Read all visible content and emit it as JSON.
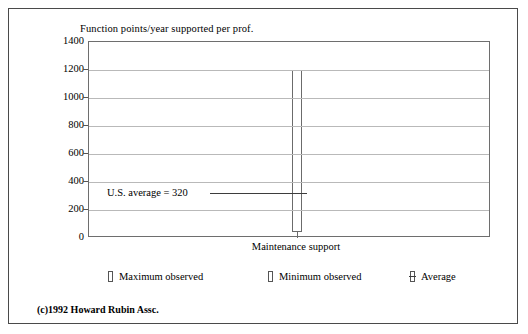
{
  "figure": {
    "copyright": "(c)1992 Howard Rubin Assc."
  },
  "chart_data": {
    "type": "bar",
    "title": "Function points/year supported per prof.",
    "xlabel": "",
    "ylabel": "",
    "categories": [
      "Maintenance support"
    ],
    "ylim": [
      0,
      1400
    ],
    "yticks": [
      0,
      200,
      400,
      600,
      800,
      1000,
      1200,
      1400
    ],
    "ytick_labels": [
      "0",
      "200",
      "400",
      "600",
      "800",
      "1000",
      "1200",
      "1400"
    ],
    "grid": true,
    "legend_position": "below",
    "series": [
      {
        "name": "Maximum observed",
        "values": [
          1200
        ]
      },
      {
        "name": "Minimum observed",
        "values": [
          40
        ]
      },
      {
        "name": "Average",
        "values": [
          320
        ]
      }
    ],
    "annotations": [
      {
        "text": "U.S. average = 320",
        "value": 320,
        "category": "Maintenance support"
      }
    ],
    "legend": [
      "Maximum observed",
      "Minimum observed",
      "Average"
    ]
  }
}
